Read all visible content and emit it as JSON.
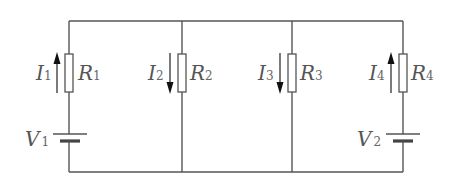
{
  "diagram": {
    "type": "circuit",
    "colors": {
      "wire": "#555555",
      "label": "#555555",
      "arrow": "#111111",
      "background": "#ffffff"
    },
    "branches": [
      {
        "id": "branch-1",
        "resistor": {
          "symbol": "R",
          "sub": "1"
        },
        "current": {
          "symbol": "I",
          "sub": "1",
          "direction": "up"
        },
        "source": {
          "symbol": "V",
          "sub": "1"
        }
      },
      {
        "id": "branch-2",
        "resistor": {
          "symbol": "R",
          "sub": "2"
        },
        "current": {
          "symbol": "I",
          "sub": "2",
          "direction": "down"
        }
      },
      {
        "id": "branch-3",
        "resistor": {
          "symbol": "R",
          "sub": "3"
        },
        "current": {
          "symbol": "I",
          "sub": "3",
          "direction": "down"
        }
      },
      {
        "id": "branch-4",
        "resistor": {
          "symbol": "R",
          "sub": "4"
        },
        "current": {
          "symbol": "I",
          "sub": "4",
          "direction": "up"
        },
        "source": {
          "symbol": "V",
          "sub": "2"
        }
      }
    ]
  }
}
